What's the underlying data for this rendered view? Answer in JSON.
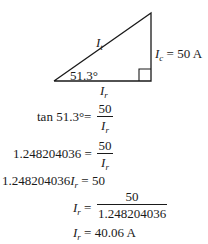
{
  "diagram": {
    "hypotenuse_label": "I",
    "hypotenuse_sub": "t",
    "vertical_label": "I",
    "vertical_sub": "c",
    "vertical_value": " = 50 A",
    "base_label": "I",
    "base_sub": "r",
    "angle_label": "51.3°"
  },
  "equations": {
    "line1": {
      "lhs": "tan 51.3°",
      "eq": "=",
      "num": "50",
      "den_var": "I",
      "den_sub": "r"
    },
    "line2": {
      "lhs": "1.248204036",
      "eq": " =",
      "num": "50",
      "den_var": "I",
      "den_sub": "r"
    },
    "line3": {
      "lhs": "1.248204036",
      "var": "I",
      "sub": "r",
      "rhs": " = 50"
    },
    "line4": {
      "var": "I",
      "sub": "r",
      "eq": " =",
      "num": "50",
      "den": "1.248204036"
    },
    "line5": {
      "var": "I",
      "sub": "r",
      "rhs": " = 40.06 A"
    }
  }
}
